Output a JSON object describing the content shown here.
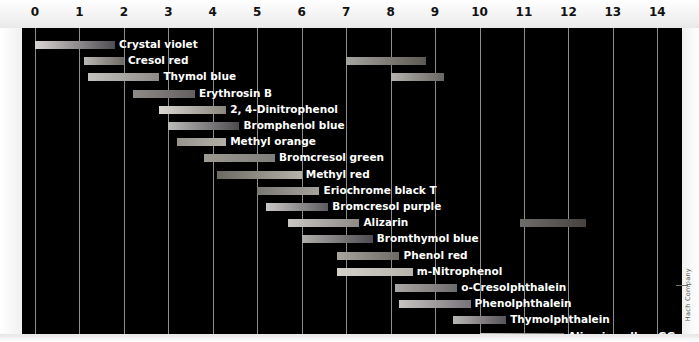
{
  "credit": "Hach Company",
  "axis": {
    "label": "pH",
    "min": 0,
    "max": 14,
    "ticks": [
      0,
      1,
      2,
      3,
      4,
      5,
      6,
      7,
      8,
      9,
      10,
      11,
      12,
      13,
      14
    ],
    "tick_labels": [
      "0",
      "1",
      "2",
      "3",
      "4",
      "5",
      "6",
      "7",
      "8",
      "9",
      "10",
      "11",
      "12",
      "13",
      "14"
    ]
  },
  "colors": {
    "plot_background": "#000000",
    "gridline": "#8d8d8d",
    "label_text": "#ffffff",
    "axis_text": "#111111",
    "page_background": "#fdfdfd"
  },
  "chart_data": {
    "type": "bar",
    "orientation": "horizontal",
    "xlabel": "pH",
    "ylabel": "",
    "xlim": [
      0,
      14
    ],
    "grid": true,
    "legend": "none",
    "categories": [
      "Crystal violet",
      "Cresol red",
      "Thymol blue",
      "Erythrosin B",
      "2, 4-Dinitrophenol",
      "Bromphenol blue",
      "Methyl orange",
      "Bromcresol green",
      "Methyl red",
      "Eriochrome black T",
      "Bromcresol purple",
      "Alizarin",
      "Bromthymol blue",
      "Phenol red",
      "m-Nitrophenol",
      "o-Cresolphthalein",
      "Phenolphthalein",
      "Thymolphthalein",
      "Alizarin yellow GG"
    ],
    "indicators": [
      {
        "name": "Crystal violet",
        "ranges": [
          {
            "start": 0.0,
            "end": 1.8,
            "from_color": "#d8d4d2",
            "to_color": "#4f4c52"
          }
        ],
        "label_after": 1.8
      },
      {
        "name": "Cresol red",
        "ranges": [
          {
            "start": 1.1,
            "end": 2.0,
            "from_color": "#b9b7b4",
            "to_color": "#6e6a63"
          },
          {
            "start": 7.0,
            "end": 8.8,
            "from_color": "#a6a49f",
            "to_color": "#5c5852"
          }
        ],
        "label_after": 2.0
      },
      {
        "name": "Thymol blue",
        "ranges": [
          {
            "start": 1.2,
            "end": 2.8,
            "from_color": "#c3c1bf",
            "to_color": "#8e8b87"
          },
          {
            "start": 8.0,
            "end": 9.2,
            "from_color": "#b4b2ae",
            "to_color": "#6a6762"
          }
        ],
        "label_after": 2.8
      },
      {
        "name": "Erythrosin B",
        "ranges": [
          {
            "start": 2.2,
            "end": 3.6,
            "from_color": "#8e8a87",
            "to_color": "#636060"
          }
        ],
        "label_after": 3.6
      },
      {
        "name": "2, 4-Dinitrophenol",
        "ranges": [
          {
            "start": 2.8,
            "end": 4.3,
            "from_color": "#d9d7d0",
            "to_color": "#87857c"
          }
        ],
        "label_after": 4.3
      },
      {
        "name": "Bromphenol blue",
        "ranges": [
          {
            "start": 3.0,
            "end": 4.6,
            "from_color": "#bdbbb8",
            "to_color": "#4e4b50"
          }
        ],
        "label_after": 4.6
      },
      {
        "name": "Methyl orange",
        "ranges": [
          {
            "start": 3.2,
            "end": 4.3,
            "from_color": "#98958f",
            "to_color": "#b2afa7"
          }
        ],
        "label_after": 4.3
      },
      {
        "name": "Bromcresol green",
        "ranges": [
          {
            "start": 3.8,
            "end": 5.4,
            "from_color": "#9d9a92",
            "to_color": "#7f7d7b"
          }
        ],
        "label_after": 5.4
      },
      {
        "name": "Methyl red",
        "ranges": [
          {
            "start": 4.1,
            "end": 6.0,
            "from_color": "#6c6964",
            "to_color": "#b5b2aa"
          }
        ],
        "label_after": 6.0
      },
      {
        "name": "Eriochrome black T",
        "ranges": [
          {
            "start": 5.0,
            "end": 6.4,
            "from_color": "#7a7874",
            "to_color": "#a5a29c"
          }
        ],
        "label_after": 6.4
      },
      {
        "name": "Bromcresol purple",
        "ranges": [
          {
            "start": 5.2,
            "end": 6.6,
            "from_color": "#c9c7c4",
            "to_color": "#5e5b60"
          }
        ],
        "label_after": 6.6
      },
      {
        "name": "Alizarin",
        "ranges": [
          {
            "start": 5.7,
            "end": 7.3,
            "from_color": "#c8c6c1",
            "to_color": "#8d8a85"
          },
          {
            "start": 10.9,
            "end": 12.4,
            "from_color": "#6f6d69",
            "to_color": "#45423f"
          }
        ],
        "label_after": 7.3
      },
      {
        "name": "Bromthymol blue",
        "ranges": [
          {
            "start": 6.0,
            "end": 7.6,
            "from_color": "#b0aeab",
            "to_color": "#4e4b51"
          }
        ],
        "label_after": 7.6
      },
      {
        "name": "Phenol red",
        "ranges": [
          {
            "start": 6.8,
            "end": 8.2,
            "from_color": "#a8a59f",
            "to_color": "#6d6a65"
          }
        ],
        "label_after": 8.2
      },
      {
        "name": "m-Nitrophenol",
        "ranges": [
          {
            "start": 6.8,
            "end": 8.5,
            "from_color": "#d2d0c9",
            "to_color": "#b6b4ab"
          }
        ],
        "label_after": 8.5
      },
      {
        "name": "o-Cresolphthalein",
        "ranges": [
          {
            "start": 8.1,
            "end": 9.5,
            "from_color": "#a9a7a4",
            "to_color": "#6e6b6d"
          }
        ],
        "label_after": 9.5
      },
      {
        "name": "Phenolphthalein",
        "ranges": [
          {
            "start": 8.2,
            "end": 9.8,
            "from_color": "#c6c4c1",
            "to_color": "#76737a"
          }
        ],
        "label_after": 9.8
      },
      {
        "name": "Thymolphthalein",
        "ranges": [
          {
            "start": 9.4,
            "end": 10.6,
            "from_color": "#b8b6b3",
            "to_color": "#57545a"
          }
        ],
        "label_after": 10.6
      },
      {
        "name": "Alizarin yellow GG",
        "ranges": [
          {
            "start": 10.0,
            "end": 11.9,
            "from_color": "#c9c7bf",
            "to_color": "#6b6962"
          }
        ],
        "label_after": 11.9
      }
    ]
  }
}
